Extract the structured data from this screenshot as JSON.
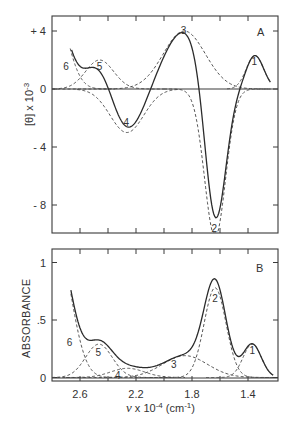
{
  "chart_data": [
    {
      "id": "A",
      "type": "line",
      "panel_label": "A",
      "title": "",
      "xlabel": "ν x 10^-4 (cm^-1)",
      "ylabel": "[θ] x 10^-3",
      "x_ticks": [
        2.6,
        2.2,
        1.8,
        1.4
      ],
      "y_ticks": [
        {
          "value": 4,
          "label": "+ 4"
        },
        {
          "value": 0,
          "label": "0"
        },
        {
          "value": -4,
          "label": "- 4"
        },
        {
          "value": -8,
          "label": "- 8"
        }
      ],
      "xlim": [
        2.8,
        1.2
      ],
      "ylim": [
        -10.3,
        5.0
      ],
      "x_reversed": true,
      "grid": false,
      "series": [
        {
          "name": "total (observed)",
          "style": "solid",
          "x_range": [
            2.66,
            1.24
          ]
        },
        {
          "name": "1",
          "style": "dashed",
          "center": 1.35,
          "amplitude": 2.3,
          "sigma": 0.062,
          "x_range": [
            1.55,
            1.24
          ]
        },
        {
          "name": "2",
          "style": "dashed",
          "center": 1.635,
          "amplitude": -10.2,
          "sigma": 0.075,
          "x_range": [
            2.0,
            1.24
          ]
        },
        {
          "name": "3",
          "style": "dashed",
          "center": 1.855,
          "amplitude": 4.0,
          "sigma": 0.15,
          "x_range": [
            2.8,
            1.24
          ]
        },
        {
          "name": "4",
          "style": "dashed",
          "center": 2.265,
          "amplitude": -3.0,
          "sigma": 0.12,
          "x_range": [
            2.62,
            1.9
          ]
        },
        {
          "name": "5",
          "style": "dashed",
          "center": 2.46,
          "amplitude": 2.0,
          "sigma": 0.1,
          "x_range": [
            2.75,
            2.0
          ]
        },
        {
          "name": "6",
          "style": "dashed",
          "center": 2.8,
          "amplitude": 6.5,
          "sigma": 0.1,
          "x_range": [
            2.67,
            2.35
          ]
        }
      ],
      "sum_offset": [
        {
          "center": 1.97,
          "amplitude": 0.0,
          "sigma": 0.1
        }
      ],
      "band_labels": [
        {
          "text": "1",
          "x": 1.355,
          "y": 1.9
        },
        {
          "text": "2",
          "x": 1.64,
          "y": -9.6
        },
        {
          "text": "3",
          "x": 1.86,
          "y": 4.1
        },
        {
          "text": "4",
          "x": 2.27,
          "y": -2.3
        },
        {
          "text": "5",
          "x": 2.46,
          "y": 1.6
        },
        {
          "text": "6",
          "x": 2.7,
          "y": 1.6
        }
      ]
    },
    {
      "id": "B",
      "type": "line",
      "panel_label": "B",
      "title": "",
      "xlabel": "ν x 10^-4 (cm^-1)",
      "ylabel": "ABSORBANCE",
      "x_ticks": [
        2.6,
        2.2,
        1.8,
        1.4
      ],
      "y_ticks": [
        {
          "value": 1,
          "label": "1"
        },
        {
          "value": 0.5,
          "label": ".5"
        },
        {
          "value": 0,
          "label": "0"
        }
      ],
      "xlim": [
        2.8,
        1.2
      ],
      "ylim": [
        -0.03,
        1.1
      ],
      "x_reversed": true,
      "grid": false,
      "series": [
        {
          "name": "total (observed)",
          "style": "solid",
          "x_range": [
            2.665,
            1.22
          ]
        },
        {
          "name": "1",
          "style": "dashed",
          "center": 1.37,
          "amplitude": 0.29,
          "sigma": 0.065,
          "x_range": [
            1.7,
            1.22
          ]
        },
        {
          "name": "2",
          "style": "dashed",
          "center": 1.635,
          "amplitude": 0.78,
          "sigma": 0.078,
          "x_range": [
            2.1,
            1.22
          ]
        },
        {
          "name": "3",
          "style": "dashed",
          "center": 1.85,
          "amplitude": 0.19,
          "sigma": 0.16,
          "x_range": [
            2.8,
            1.22
          ]
        },
        {
          "name": "4",
          "style": "dashed",
          "center": 2.26,
          "amplitude": 0.08,
          "sigma": 0.12,
          "x_range": [
            2.7,
            1.85
          ]
        },
        {
          "name": "5",
          "style": "dashed",
          "center": 2.465,
          "amplitude": 0.29,
          "sigma": 0.095,
          "x_range": [
            2.8,
            1.95
          ]
        },
        {
          "name": "6",
          "style": "dashed",
          "center": 2.77,
          "amplitude": 1.2,
          "sigma": 0.105,
          "x_range": [
            2.665,
            2.1
          ]
        }
      ],
      "band_labels": [
        {
          "text": "1",
          "x": 1.37,
          "y": 0.24
        },
        {
          "text": "2",
          "x": 1.635,
          "y": 0.69
        },
        {
          "text": "3",
          "x": 1.93,
          "y": 0.12
        },
        {
          "text": "4",
          "x": 2.33,
          "y": 0.02
        },
        {
          "text": "5",
          "x": 2.47,
          "y": 0.22
        },
        {
          "text": "6",
          "x": 2.675,
          "y": 0.31
        }
      ]
    }
  ],
  "axis": {
    "x_tick_labels": [
      "2.6",
      "2.2",
      "1.8",
      "1.4"
    ],
    "x_label_nu": "ν",
    "x_label_rest": " x 10",
    "x_label_exp": "-4",
    "x_label_unit": " (cm",
    "x_label_unit_exp": "-1",
    "x_label_close": ")",
    "panel_a_ylabel_main": "[θ] x 10",
    "panel_a_ylabel_exp": "-3",
    "panel_b_ylabel": "ABSORBANCE"
  },
  "colors": {
    "line": "#2b2b2b",
    "dashed": "#444444",
    "frame": "#3a3a3a",
    "background": "#ffffff"
  }
}
